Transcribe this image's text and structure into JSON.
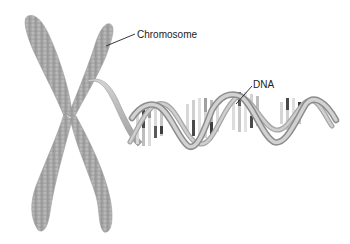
{
  "diagram": {
    "labels": {
      "chromosome": "Chromosome",
      "dna": "DNA"
    },
    "colors": {
      "background": "#ffffff",
      "chromosome_fill": "#a8a8a8",
      "chromosome_band": "#8f8f8f",
      "backbone": "#b9b9b9",
      "backbone_edge": "#8a8a8a",
      "base_light": "#d8d8d8",
      "base_mid": "#9a9a9a",
      "base_dark": "#4a4a4a",
      "leader_line": "#222222"
    }
  }
}
